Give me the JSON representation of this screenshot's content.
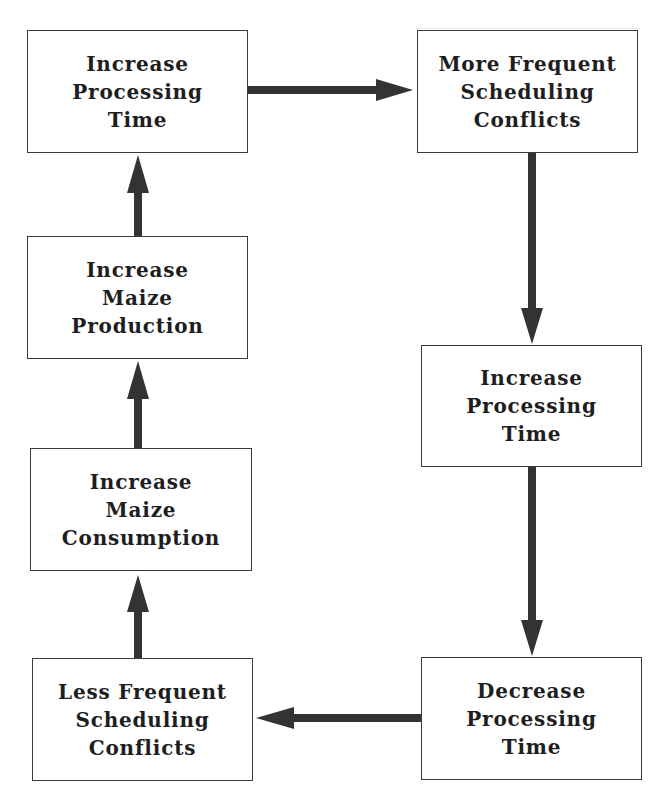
{
  "diagram": {
    "type": "feedback-cycle flowchart",
    "colors": {
      "box_border": "#3a3a3a",
      "arrow": "#333333",
      "text": "#1e1e1e",
      "background": "#ffffff"
    },
    "nodes": [
      {
        "id": "n1",
        "lines": [
          "Increase",
          "Processing",
          "Time"
        ]
      },
      {
        "id": "n2",
        "lines": [
          "More Frequent",
          "Scheduling",
          "Conflicts"
        ]
      },
      {
        "id": "n3",
        "lines": [
          "Increase",
          "Processing",
          "Time"
        ]
      },
      {
        "id": "n4",
        "lines": [
          "Decrease",
          "Processing",
          "Time"
        ]
      },
      {
        "id": "n5",
        "lines": [
          "Less Frequent",
          "Scheduling",
          "Conflicts"
        ]
      },
      {
        "id": "n6",
        "lines": [
          "Increase",
          "Maize",
          "Consumption"
        ]
      },
      {
        "id": "n7",
        "lines": [
          "Increase",
          "Maize",
          "Production"
        ]
      }
    ],
    "edges": [
      {
        "from": "n1",
        "to": "n2",
        "direction": "right"
      },
      {
        "from": "n2",
        "to": "n3",
        "direction": "down"
      },
      {
        "from": "n3",
        "to": "n4",
        "direction": "down"
      },
      {
        "from": "n4",
        "to": "n5",
        "direction": "left"
      },
      {
        "from": "n5",
        "to": "n6",
        "direction": "up"
      },
      {
        "from": "n6",
        "to": "n7",
        "direction": "up"
      },
      {
        "from": "n7",
        "to": "n1",
        "direction": "up"
      }
    ]
  }
}
